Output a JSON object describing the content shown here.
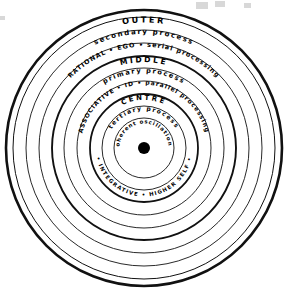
{
  "diagram": {
    "type": "concentric-circles",
    "center": {
      "x": 144,
      "y": 148
    },
    "stroke_color": "#111111",
    "background_color": "#ffffff",
    "center_dot": {
      "label": "center-point",
      "radius": 6,
      "color": "#000000"
    },
    "rings": [
      {
        "id": "outer",
        "heading": "OUTER",
        "process": "secondary process",
        "attributes": "RATIONAL • EGO • serial processing",
        "radii": [
          138,
          131,
          118,
          105
        ],
        "heading_radius": 128,
        "process_radius": 116,
        "attributes_radius": 103
      },
      {
        "id": "middle",
        "heading": "MIDDLE",
        "process": "primary process",
        "attributes": "ASSOCIATIVE • ID • parallel processing",
        "radii": [
          92,
          80,
          67
        ],
        "heading_radius": 88,
        "process_radius": 77,
        "attributes_radius": 65
      },
      {
        "id": "centre",
        "heading": "CENTRE",
        "process": "tertiary process",
        "attributes": "coherent oscillations",
        "lower_attributes": "• INTEGRATIVE • HIGHER SELF •",
        "radii": [
          54,
          42,
          30
        ],
        "heading_radius": 50,
        "process_radius": 39,
        "attributes_radius": 26,
        "lower_attributes_radius": 47
      }
    ]
  }
}
